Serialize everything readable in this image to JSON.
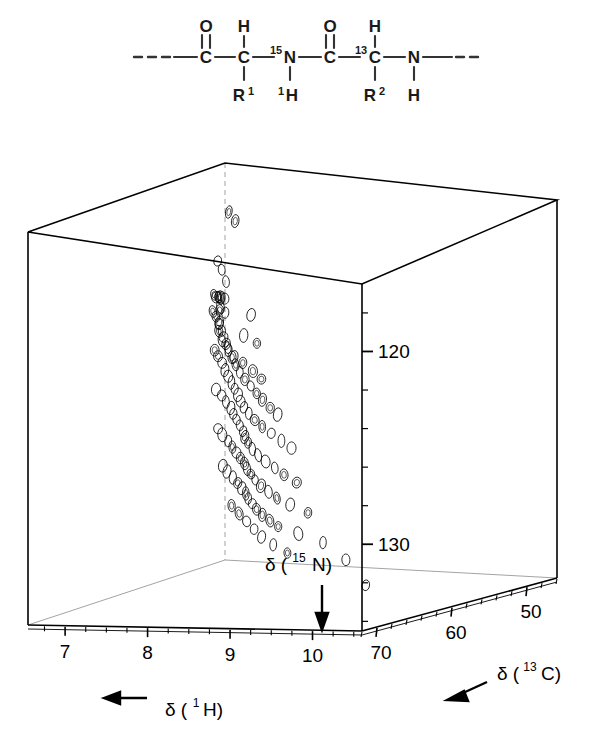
{
  "figure": {
    "kind": "3d-nmr-spectrum",
    "background": "#ffffff",
    "ink": "#000000"
  },
  "structure": {
    "name": "peptide-backbone-diagram",
    "bond_color": "#333333",
    "atoms": [
      {
        "id": "a1",
        "label": "C",
        "x": 206,
        "y": 57,
        "sup": ""
      },
      {
        "id": "a2",
        "label": "C",
        "x": 244,
        "y": 57,
        "sup": ""
      },
      {
        "id": "a3",
        "label": "N",
        "x": 290,
        "y": 57,
        "sup": "15"
      },
      {
        "id": "a4",
        "label": "C",
        "x": 330,
        "y": 57,
        "sup": ""
      },
      {
        "id": "a5",
        "label": "C",
        "x": 375,
        "y": 57,
        "sup": "13"
      },
      {
        "id": "a6",
        "label": "N",
        "x": 414,
        "y": 57,
        "sup": ""
      },
      {
        "id": "o1",
        "label": "O",
        "x": 206,
        "y": 26,
        "sup": ""
      },
      {
        "id": "o2",
        "label": "O",
        "x": 330,
        "y": 26,
        "sup": ""
      },
      {
        "id": "h1",
        "label": "H",
        "x": 244,
        "y": 26,
        "sup": ""
      },
      {
        "id": "h2",
        "label": "H",
        "x": 375,
        "y": 26,
        "sup": ""
      },
      {
        "id": "h3",
        "label": "H",
        "x": 290,
        "y": 95,
        "sup": "1"
      },
      {
        "id": "h4",
        "label": "H",
        "x": 414,
        "y": 95,
        "sup": ""
      },
      {
        "id": "r1",
        "label": "R",
        "x": 244,
        "y": 95,
        "sub": "1"
      },
      {
        "id": "r2",
        "label": "R",
        "x": 375,
        "y": 95,
        "sub": "2"
      }
    ],
    "labels": {
      "carbon": "C",
      "nitrogen": "N",
      "oxygen": "O",
      "hydrogen": "H",
      "sidechain": "R",
      "n15_superscript": "15",
      "c13_superscript": "13",
      "h1_superscript": "1",
      "r1_subscript": "1",
      "r2_subscript": "2"
    }
  },
  "chart_data": {
    "type": "scatter",
    "projection": "3d-cube-perspective",
    "title": "",
    "subtitle": "",
    "grid": false,
    "legend": null,
    "axes": {
      "x": {
        "name": "proton",
        "label": "δ (¹H)",
        "label_base": "δ (",
        "label_sup": "1",
        "label_nucleus": "H)",
        "unit": "ppm",
        "ticks": [
          10,
          9,
          8,
          7
        ],
        "tick_labels": [
          "10",
          "9",
          "8",
          "7"
        ],
        "minor_ticks_per_interval": 4,
        "range": [
          10.6,
          6.55
        ],
        "direction": "decreasing-left-to-right",
        "arrow": "left"
      },
      "y": {
        "name": "carbon-13",
        "label": "δ (¹³C)",
        "label_base": "δ (",
        "label_sup": "13",
        "label_nucleus": "C)",
        "unit": "ppm",
        "ticks": [
          70,
          60,
          50
        ],
        "tick_labels": [
          "70",
          "60",
          "50"
        ],
        "minor_ticks_per_interval": 4,
        "range": [
          72,
          46
        ],
        "direction": "decreasing-left-to-right",
        "arrow": "down-left"
      },
      "z": {
        "name": "nitrogen-15",
        "label": "δ (¹⁵N)",
        "label_base": "δ (",
        "label_sup": "15",
        "label_nucleus": "N)",
        "unit": "ppm",
        "ticks": [
          120,
          130
        ],
        "tick_labels": [
          "120",
          "130"
        ],
        "minor_ticks_per_interval": 5,
        "range": [
          116.5,
          134.5
        ],
        "direction": "increasing-downward",
        "arrow": "down"
      }
    },
    "peak_count": 196,
    "contour_shape": "ellipse",
    "clusters": [
      {
        "name": "alpha-helix-CA-band",
        "region": "13C 52-58, 15N 120-123"
      },
      {
        "name": "main-backbone-amide-region",
        "region": "1H 7.3-8.8, 15N 122-131"
      }
    ],
    "points": [
      [
        7.22,
        52.6,
        118.0
      ],
      [
        7.28,
        52.4,
        118.4
      ],
      [
        8.05,
        62.1,
        119.4
      ],
      [
        7.15,
        53.3,
        120.1
      ],
      [
        7.18,
        53.1,
        120.5
      ],
      [
        7.96,
        61.2,
        121.0
      ],
      [
        8.2,
        60.4,
        121.1
      ],
      [
        7.62,
        58.1,
        121.3
      ],
      [
        8.42,
        63.8,
        121.5
      ],
      [
        8.68,
        64.9,
        121.6
      ],
      [
        7.42,
        56.0,
        121.8
      ],
      [
        7.05,
        52.0,
        121.9
      ],
      [
        7.08,
        51.6,
        122.0
      ],
      [
        6.98,
        50.9,
        122.1
      ],
      [
        6.9,
        50.2,
        122.2
      ],
      [
        6.82,
        49.6,
        122.3
      ],
      [
        6.74,
        49.0,
        122.4
      ],
      [
        6.66,
        48.4,
        122.4
      ],
      [
        7.34,
        55.2,
        122.5
      ],
      [
        7.5,
        57.0,
        122.6
      ],
      [
        7.7,
        58.8,
        122.7
      ],
      [
        7.88,
        60.0,
        122.8
      ],
      [
        8.12,
        61.8,
        122.9
      ],
      [
        8.3,
        62.6,
        123.0
      ],
      [
        8.55,
        64.0,
        123.1
      ],
      [
        8.78,
        65.4,
        123.2
      ],
      [
        6.6,
        47.9,
        123.2
      ],
      [
        6.7,
        48.6,
        123.3
      ],
      [
        6.86,
        49.9,
        123.4
      ],
      [
        7.0,
        51.1,
        123.5
      ],
      [
        7.12,
        52.2,
        123.6
      ],
      [
        7.26,
        53.4,
        123.7
      ],
      [
        7.4,
        54.6,
        123.8
      ],
      [
        7.55,
        55.8,
        123.9
      ],
      [
        7.72,
        57.2,
        124.0
      ],
      [
        7.9,
        58.6,
        124.1
      ],
      [
        8.08,
        59.9,
        124.2
      ],
      [
        8.25,
        61.0,
        124.3
      ],
      [
        8.45,
        62.4,
        124.4
      ],
      [
        8.62,
        63.5,
        124.5
      ],
      [
        8.85,
        65.0,
        124.6
      ],
      [
        9.05,
        66.2,
        124.7
      ],
      [
        6.65,
        48.2,
        124.8
      ],
      [
        6.78,
        49.2,
        124.9
      ],
      [
        6.94,
        50.4,
        125.0
      ],
      [
        7.1,
        51.8,
        125.1
      ],
      [
        7.24,
        52.9,
        125.2
      ],
      [
        7.38,
        54.0,
        125.3
      ],
      [
        7.52,
        55.1,
        125.4
      ],
      [
        7.66,
        56.2,
        125.5
      ],
      [
        7.8,
        57.4,
        125.6
      ],
      [
        7.94,
        58.5,
        125.7
      ],
      [
        8.1,
        59.6,
        125.8
      ],
      [
        8.28,
        60.8,
        125.9
      ],
      [
        8.48,
        62.0,
        126.0
      ],
      [
        8.7,
        63.2,
        126.1
      ],
      [
        8.95,
        64.6,
        126.2
      ],
      [
        9.2,
        66.0,
        126.3
      ],
      [
        6.72,
        48.8,
        126.4
      ],
      [
        6.88,
        49.8,
        126.5
      ],
      [
        7.04,
        51.0,
        126.6
      ],
      [
        7.2,
        52.1,
        126.7
      ],
      [
        7.33,
        53.2,
        126.8
      ],
      [
        7.46,
        54.2,
        126.9
      ],
      [
        7.6,
        55.3,
        127.0
      ],
      [
        7.74,
        56.4,
        127.1
      ],
      [
        7.86,
        57.5,
        127.2
      ],
      [
        8.0,
        58.6,
        127.3
      ],
      [
        8.16,
        59.8,
        127.4
      ],
      [
        8.34,
        61.0,
        127.5
      ],
      [
        8.54,
        62.2,
        127.6
      ],
      [
        8.76,
        63.4,
        127.7
      ],
      [
        9.0,
        64.8,
        127.8
      ],
      [
        9.3,
        66.4,
        127.9
      ],
      [
        6.8,
        49.4,
        128.0
      ],
      [
        6.96,
        50.6,
        128.1
      ],
      [
        7.14,
        51.8,
        128.2
      ],
      [
        7.3,
        53.0,
        128.3
      ],
      [
        7.44,
        54.0,
        128.4
      ],
      [
        7.58,
        55.0,
        128.5
      ],
      [
        7.72,
        56.0,
        128.6
      ],
      [
        7.84,
        57.0,
        128.7
      ],
      [
        7.98,
        58.0,
        128.8
      ],
      [
        8.14,
        59.2,
        128.9
      ],
      [
        8.32,
        60.4,
        129.0
      ],
      [
        8.52,
        61.6,
        129.1
      ],
      [
        8.74,
        62.9,
        129.2
      ],
      [
        9.02,
        64.2,
        129.3
      ],
      [
        9.4,
        66.0,
        129.4
      ],
      [
        6.92,
        50.1,
        129.5
      ],
      [
        7.08,
        51.3,
        129.6
      ],
      [
        7.26,
        52.5,
        129.7
      ],
      [
        7.42,
        53.6,
        129.8
      ],
      [
        7.56,
        54.6,
        129.9
      ],
      [
        7.7,
        55.6,
        130.0
      ],
      [
        7.82,
        56.6,
        130.1
      ],
      [
        7.96,
        57.6,
        130.2
      ],
      [
        8.12,
        58.8,
        130.3
      ],
      [
        8.3,
        60.0,
        130.4
      ],
      [
        8.5,
        61.2,
        130.5
      ],
      [
        8.72,
        62.5,
        130.6
      ],
      [
        9.1,
        64.0,
        130.7
      ],
      [
        9.6,
        66.2,
        130.8
      ],
      [
        7.2,
        52.0,
        131.0
      ],
      [
        7.4,
        53.2,
        131.2
      ],
      [
        7.6,
        54.4,
        131.4
      ],
      [
        7.8,
        55.6,
        131.6
      ],
      [
        8.0,
        56.8,
        131.8
      ],
      [
        8.25,
        58.0,
        132.0
      ],
      [
        8.55,
        59.4,
        132.2
      ],
      [
        10.3,
        68.2,
        132.6
      ],
      [
        9.95,
        67.0,
        131.5
      ]
    ]
  },
  "annotations": {
    "n15_axis_arrow": "down",
    "h1_axis_arrow": "left",
    "c13_axis_arrow": "down-left"
  }
}
